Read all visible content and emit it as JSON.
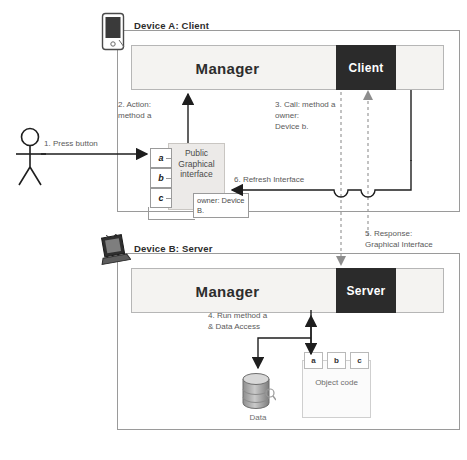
{
  "diagram": {
    "colors": {
      "endpoint_fill": "#2b2b2b",
      "manager_fill": "#f4f3f1",
      "frame_stroke": "#9a9a9a",
      "interface_fill": "#eceae8",
      "dashed_stroke": "#9a9a9a",
      "text": "#333333"
    }
  },
  "device_a": {
    "label": "Device A: Client",
    "icon": "pda-device-icon",
    "manager": "Manager",
    "endpoint": "Client",
    "interface": {
      "title": "Public\nGraphical\ninterface",
      "slots": [
        "a",
        "b",
        "c"
      ],
      "owner_box": "owner:\nDevice B."
    }
  },
  "device_b": {
    "label": "Device B: Server",
    "icon": "laptop-device-icon",
    "manager": "Manager",
    "endpoint": "Server",
    "data_store": {
      "label": "Data",
      "icon": "database-cylinder-icon"
    },
    "object_code": {
      "title": "Object\ncode",
      "slots": [
        "a",
        "b",
        "c"
      ]
    }
  },
  "actor": {
    "icon": "stick-figure-user-icon"
  },
  "steps": [
    {
      "id": 1,
      "text": "1. Press button"
    },
    {
      "id": 2,
      "text": "2. Action:\n     method a"
    },
    {
      "id": 3,
      "text": "3. Call: method a\n     owner:\n     Device b."
    },
    {
      "id": 4,
      "text": "4. Run  method a\n     & Data Access"
    },
    {
      "id": 5,
      "text": "5. Response:\n     Graphical Interface"
    },
    {
      "id": 6,
      "text": "6. Refresh Interface"
    }
  ]
}
